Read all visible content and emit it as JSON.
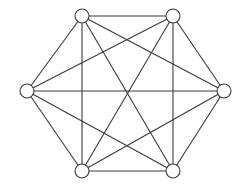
{
  "diagram": {
    "type": "complete-graph",
    "name": "K6",
    "colors": {
      "stroke": "#3a3a3a",
      "node_fill": "#ffffff",
      "background": "#ffffff"
    },
    "node_radius": 7,
    "nodes": [
      {
        "id": "n1",
        "x": 82,
        "y": 16
      },
      {
        "id": "n2",
        "x": 173,
        "y": 16
      },
      {
        "id": "n3",
        "x": 224,
        "y": 91
      },
      {
        "id": "n4",
        "x": 173,
        "y": 171
      },
      {
        "id": "n5",
        "x": 82,
        "y": 171
      },
      {
        "id": "n6",
        "x": 27,
        "y": 91
      }
    ],
    "edges": [
      [
        "n1",
        "n2"
      ],
      [
        "n1",
        "n3"
      ],
      [
        "n1",
        "n4"
      ],
      [
        "n1",
        "n5"
      ],
      [
        "n1",
        "n6"
      ],
      [
        "n2",
        "n3"
      ],
      [
        "n2",
        "n4"
      ],
      [
        "n2",
        "n5"
      ],
      [
        "n2",
        "n6"
      ],
      [
        "n3",
        "n4"
      ],
      [
        "n3",
        "n5"
      ],
      [
        "n3",
        "n6"
      ],
      [
        "n4",
        "n5"
      ],
      [
        "n4",
        "n6"
      ],
      [
        "n5",
        "n6"
      ]
    ]
  }
}
